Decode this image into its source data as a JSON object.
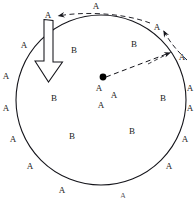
{
  "figure": {
    "title": "",
    "circle": {
      "cx": 101,
      "cy": 100,
      "r": 85,
      "stroke": "#14141a",
      "stroke_width": 1.1,
      "fill": "none"
    },
    "center_dot": {
      "cx": 103,
      "cy": 77,
      "r": 3.4,
      "color": "#000000"
    },
    "solid_block_arrow": {
      "name": "downward-block-arrow",
      "shaft": {
        "x": 44,
        "y": 19,
        "width": 9,
        "height": 45
      },
      "head_points": "35,62 62,62 48.5,82",
      "stroke": "#14141a",
      "fill": "#ffffff",
      "direction": "down"
    },
    "dashed_radius": {
      "name": "dashed-radius-arrow",
      "from": {
        "x": 105,
        "y": 77
      },
      "to": {
        "x": 174,
        "y": 51
      },
      "stroke": "#14141a",
      "dash": "5,3.5",
      "arrowhead": "to"
    },
    "dashed_arc_top": {
      "name": "dashed-arc-top-left",
      "path": "M 148 22 C 120 12 80 11 57 16",
      "stroke": "#23232a",
      "dash": "5,3.5",
      "arrowhead_at": {
        "x": 57,
        "y": 16,
        "angle": 190
      }
    },
    "dashed_arc_right": {
      "name": "dashed-arc-right",
      "path": "M 186 58 C 176 50 168 40 162 29",
      "stroke": "#23232a",
      "dash": "5,3",
      "arrowhead_at": {
        "x": 162,
        "y": 29,
        "angle": -62
      }
    },
    "dashed_stub_right": {
      "name": "dashed-stub-lower-right",
      "path": "M 150 63 L 172 51",
      "stroke": "#23232a",
      "dash": "4,3",
      "arrowhead_at": {
        "x": 172,
        "y": 51,
        "angle": -28
      }
    },
    "labels_a": [
      {
        "text": "A",
        "x": 96,
        "y": 6,
        "tone": "normal"
      },
      {
        "text": "A",
        "x": 48,
        "y": 15,
        "tone": "normal"
      },
      {
        "text": "A",
        "x": 157,
        "y": 27,
        "tone": "normal"
      },
      {
        "text": "A",
        "x": 182,
        "y": 57,
        "tone": "normal"
      },
      {
        "text": "A",
        "x": 24,
        "y": 45,
        "tone": "normal"
      },
      {
        "text": "A",
        "x": 6,
        "y": 76,
        "tone": "normal"
      },
      {
        "text": "A",
        "x": 6,
        "y": 108,
        "tone": "normal"
      },
      {
        "text": "A",
        "x": 13,
        "y": 139,
        "tone": "normal"
      },
      {
        "text": "A",
        "x": 30,
        "y": 166,
        "tone": "normal"
      },
      {
        "text": "A",
        "x": 62,
        "y": 190,
        "tone": "normal"
      },
      {
        "text": "A",
        "x": 123,
        "y": 196,
        "tone": "faint"
      },
      {
        "text": "A",
        "x": 169,
        "y": 166,
        "tone": "normal"
      },
      {
        "text": "A",
        "x": 185,
        "y": 139,
        "tone": "normal"
      },
      {
        "text": "A",
        "x": 190,
        "y": 108,
        "tone": "normal"
      },
      {
        "text": "A",
        "x": 190,
        "y": 88,
        "tone": "normal"
      },
      {
        "text": "A",
        "x": 99,
        "y": 88,
        "tone": "normal"
      },
      {
        "text": "A",
        "x": 114,
        "y": 95,
        "tone": "normal"
      },
      {
        "text": "A",
        "x": 101,
        "y": 105,
        "tone": "normal"
      }
    ],
    "labels_b": [
      {
        "text": "B",
        "x": 74,
        "y": 50,
        "tone": "normal"
      },
      {
        "text": "B",
        "x": 134,
        "y": 44,
        "tone": "normal"
      },
      {
        "text": "B",
        "x": 54,
        "y": 98,
        "tone": "normal"
      },
      {
        "text": "B",
        "x": 163,
        "y": 98,
        "tone": "normal"
      },
      {
        "text": "B",
        "x": 72,
        "y": 136,
        "tone": "normal"
      },
      {
        "text": "B",
        "x": 132,
        "y": 131,
        "tone": "normal"
      }
    ]
  }
}
